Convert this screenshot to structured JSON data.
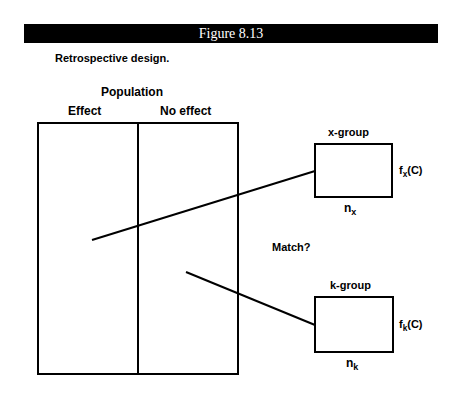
{
  "figure": {
    "title": "Figure 8.13",
    "caption": "Retrospective design."
  },
  "population": {
    "title": "Population",
    "columns": [
      "Effect",
      "No effect"
    ]
  },
  "x_group": {
    "label": "x-group",
    "f_main": "f",
    "f_sub": "x",
    "f_arg": "(C)",
    "n_main": "n",
    "n_sub": "x"
  },
  "k_group": {
    "label": "k-group",
    "f_main": "f",
    "f_sub": "k",
    "f_arg": "(C)",
    "n_main": "n",
    "n_sub": "k"
  },
  "match_label": "Match?",
  "colors": {
    "title_bar_bg": "#000000",
    "title_bar_text": "#ffffff",
    "stroke": "#000000"
  }
}
